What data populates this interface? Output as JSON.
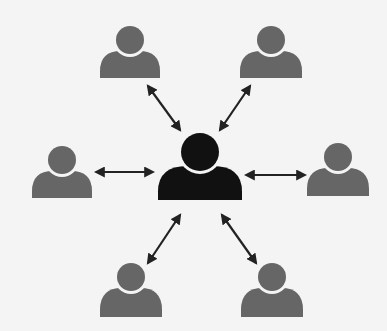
{
  "diagram": {
    "type": "hub-and-spoke network",
    "colors": {
      "background": "#f4f4f4",
      "hub": "#111111",
      "peer": "#666666",
      "arrow": "#222222"
    },
    "hub": {
      "name": "central-user",
      "cx": 200,
      "head_cy": 152,
      "head_r": 19,
      "body": [
        158,
        166,
        242,
        200
      ]
    },
    "peers": [
      {
        "name": "peer-top-left",
        "cx": 130,
        "head_cy": 40,
        "head_r": 14,
        "body": [
          100,
          51,
          160,
          78
        ]
      },
      {
        "name": "peer-top-right",
        "cx": 271,
        "head_cy": 40,
        "head_r": 14,
        "body": [
          240,
          51,
          302,
          78
        ]
      },
      {
        "name": "peer-left",
        "cx": 62,
        "head_cy": 160,
        "head_r": 14,
        "body": [
          32,
          171,
          92,
          198
        ]
      },
      {
        "name": "peer-right",
        "cx": 338,
        "head_cy": 157,
        "head_r": 14,
        "body": [
          307,
          168,
          369,
          196
        ]
      },
      {
        "name": "peer-bottom-left",
        "cx": 131,
        "head_cy": 277,
        "head_r": 14,
        "body": [
          100,
          288,
          162,
          317
        ]
      },
      {
        "name": "peer-bottom-right",
        "cx": 272,
        "head_cy": 277,
        "head_r": 14,
        "body": [
          241,
          288,
          303,
          317
        ]
      }
    ],
    "arrows": [
      {
        "name": "arrow-top-left",
        "x1": 148,
        "y1": 86,
        "x2": 180,
        "y2": 130
      },
      {
        "name": "arrow-top-right",
        "x1": 250,
        "y1": 86,
        "x2": 220,
        "y2": 130
      },
      {
        "name": "arrow-left",
        "x1": 96,
        "y1": 172,
        "x2": 153,
        "y2": 172
      },
      {
        "name": "arrow-right",
        "x1": 246,
        "y1": 175,
        "x2": 305,
        "y2": 175
      },
      {
        "name": "arrow-bottom-left",
        "x1": 180,
        "y1": 215,
        "x2": 148,
        "y2": 263
      },
      {
        "name": "arrow-bottom-right",
        "x1": 222,
        "y1": 215,
        "x2": 256,
        "y2": 263
      }
    ]
  }
}
